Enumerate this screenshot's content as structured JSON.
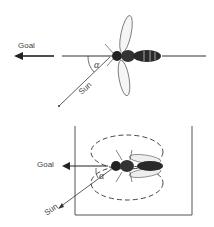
{
  "top_panel": {
    "goal_label": "Goal",
    "sun_label": "Sun",
    "angle_label": "α"
  },
  "bottom_panel": {
    "goal_label": "Goal",
    "sun_label": "Sun",
    "angle_label": "α"
  }
}
